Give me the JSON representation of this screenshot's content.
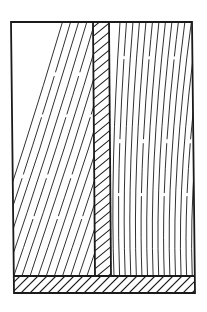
{
  "figure": {
    "width": 207,
    "height": 312,
    "background": "#ffffff",
    "stroke": "#1a1a1a",
    "outline_width": 1.8,
    "grain_width": 0.9,
    "hatch_width": 1.1
  },
  "outline": {
    "top_left": [
      11,
      22
    ],
    "top_right": [
      192,
      22
    ],
    "bottom_right": [
      195,
      293
    ],
    "bottom_left": [
      14,
      293
    ]
  },
  "stem": {
    "top_left_x": 93,
    "top_right_x": 109,
    "bottom_left_x": 95,
    "bottom_right_x": 111,
    "top_y": 22,
    "bottom_y": 276,
    "hatch_spacing": 9
  },
  "base": {
    "top_y": 276,
    "bottom_y": 293,
    "hatch_spacing": 9
  },
  "left_panel": {
    "grain": "diagonal",
    "line_count": 14,
    "slope": 0.28
  },
  "right_panel": {
    "grain": "curved",
    "line_count": 15
  }
}
